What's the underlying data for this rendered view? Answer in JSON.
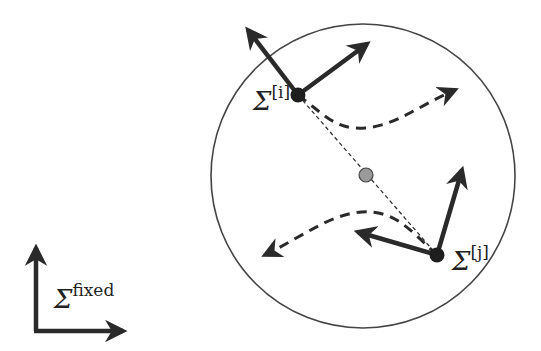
{
  "diagram": {
    "type": "reference-frames",
    "colors": {
      "ink": "#2a2a2a",
      "circle": "#444444",
      "center_point": "#9a9a9a",
      "background": "#ffffff"
    },
    "frames": [
      {
        "id": "i",
        "symbol": "Σ",
        "superscript": "[i]"
      },
      {
        "id": "j",
        "symbol": "Σ",
        "superscript": "[j]"
      },
      {
        "id": "fixed",
        "symbol": "Σ",
        "superscript": "fixed"
      }
    ]
  }
}
